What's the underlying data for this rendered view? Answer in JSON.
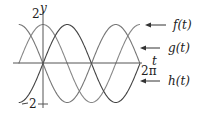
{
  "chart_data": {
    "type": "line",
    "title": "",
    "xlabel": "t",
    "ylabel": "y",
    "x_ticks": [
      "2π"
    ],
    "y_ticks": [
      "2",
      "-2"
    ],
    "xlim": [
      -1.5708,
      6.2832
    ],
    "ylim": [
      -2,
      2
    ],
    "grid": false,
    "series": [
      {
        "name": "f(t)",
        "formula": "2cos(t)",
        "color": "#888888",
        "x": [
          -1.5708,
          0,
          1.5708,
          3.1416,
          4.7124,
          6.2832
        ],
        "values": [
          0,
          2,
          0,
          -2,
          0,
          2
        ]
      },
      {
        "name": "g(t)",
        "formula": "-2sin(t)",
        "color": "#777777",
        "x": [
          -1.5708,
          0,
          1.5708,
          3.1416,
          4.7124,
          6.2832
        ],
        "values": [
          2,
          0,
          -2,
          0,
          2,
          0
        ]
      },
      {
        "name": "h(t)",
        "formula": "2sin(t)",
        "color": "#444444",
        "x": [
          -1.5708,
          0,
          1.5708,
          3.1416,
          4.7124,
          6.2832
        ],
        "values": [
          -2,
          0,
          2,
          0,
          -2,
          0
        ]
      }
    ],
    "annotations": [
      "f(t)",
      "g(t)",
      "h(t)"
    ]
  },
  "labels": {
    "y_axis": "y",
    "t_axis": "t",
    "y_top": "2",
    "y_bottom": "2",
    "x_end": "2π",
    "f": "f(t)",
    "g": "g(t)",
    "h": "h(t)"
  }
}
